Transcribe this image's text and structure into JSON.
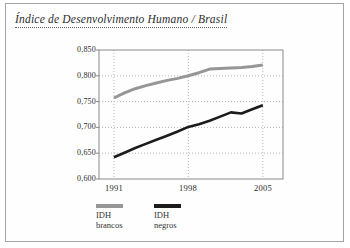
{
  "page": {
    "title": "Índice de Desenvolvimento Humano / Brasil"
  },
  "chart_data": {
    "type": "line",
    "title": "Índice de Desenvolvimento Humano / Brasil",
    "x": [
      1991,
      1992,
      1993,
      1994,
      1995,
      1996,
      1997,
      1998,
      1999,
      2000,
      2001,
      2002,
      2003,
      2004,
      2005
    ],
    "series": [
      {
        "name": "IDH brancos",
        "color": "#969696",
        "values": [
          0.757,
          0.767,
          0.775,
          0.781,
          0.786,
          0.791,
          0.795,
          0.8,
          0.806,
          0.813,
          0.814,
          0.815,
          0.816,
          0.818,
          0.821
        ]
      },
      {
        "name": "IDH negros",
        "color": "#1c1c1c",
        "values": [
          0.642,
          0.651,
          0.66,
          0.668,
          0.676,
          0.684,
          0.692,
          0.701,
          0.706,
          0.713,
          0.721,
          0.729,
          0.727,
          0.735,
          0.743
        ]
      }
    ],
    "xlim": [
      1989.6,
      2006.9
    ],
    "ylim": [
      0.6,
      0.85
    ],
    "yticks": [
      0.6,
      0.65,
      0.7,
      0.75,
      0.8,
      0.85
    ],
    "ytick_labels": [
      "0,850",
      "0,800",
      "0,750",
      "0,700",
      "0,650",
      "0,600"
    ],
    "xticks": [
      1991,
      1998,
      2005
    ],
    "xtick_labels": [
      "1991",
      "1998",
      "2005"
    ],
    "grid": "dotted",
    "legend_position": "bottom-left",
    "xlabel": "",
    "ylabel": ""
  },
  "legend": {
    "items": [
      {
        "line1": "IDH",
        "line2": "brancos",
        "color": "#969696"
      },
      {
        "line1": "IDH",
        "line2": "negros",
        "color": "#1c1c1c"
      }
    ]
  },
  "colors": {
    "card_border": "#a5a5a5",
    "plot_border": "#8a8a8a",
    "grid": "#b8b8b8",
    "text": "#2b2b2b"
  }
}
